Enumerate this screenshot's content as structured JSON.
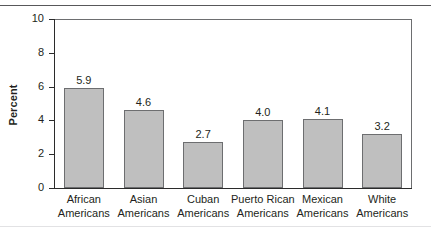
{
  "chart_data": {
    "type": "bar",
    "title": "",
    "xlabel": "",
    "ylabel": "Percent",
    "ylim": [
      0,
      10
    ],
    "yticks": [
      0,
      2,
      4,
      6,
      8,
      10
    ],
    "grid": false,
    "legend": null,
    "categories": [
      "African Americans",
      "Asian Americans",
      "Cuban Americans",
      "Puerto Rican Americans",
      "Mexican Americans",
      "White Americans"
    ],
    "category_lines": [
      [
        "African",
        "Americans"
      ],
      [
        "Asian",
        "Americans"
      ],
      [
        "Cuban",
        "Americans"
      ],
      [
        "Puerto Rican",
        "Americans"
      ],
      [
        "Mexican",
        "Americans"
      ],
      [
        "White",
        "Americans"
      ]
    ],
    "values": [
      5.9,
      4.6,
      2.7,
      4.0,
      4.1,
      3.2
    ],
    "value_labels": [
      "5.9",
      "4.6",
      "2.7",
      "4.0",
      "4.1",
      "3.2"
    ],
    "tick_labels": [
      "0",
      "2",
      "4",
      "6",
      "8",
      "10"
    ],
    "colors": {
      "bar_fill": "#bfbfbf",
      "bar_stroke": "#6d6e70",
      "axis": "#2b2b2b",
      "text": "#231f20",
      "frame": "#6d6e70",
      "rule_top": "#58585a",
      "rule_bottom": "#e2e2e4",
      "background": "#ffffff"
    }
  }
}
